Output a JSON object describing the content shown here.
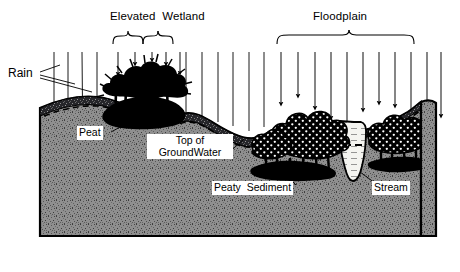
{
  "diagram": {
    "title_section_labels": {
      "elevated_wetland": "Elevated  Wetland",
      "floodplain": "Floodplain"
    },
    "annotations": {
      "rain": "Rain",
      "peat": "Peat",
      "top_of_groundwater_line1": "Top of",
      "top_of_groundwater_line2": "GroundWater",
      "peaty_sediment": "Peaty  Sediment",
      "stream": "Stream"
    },
    "colors": {
      "ink": "#000000",
      "subsurface_fill": "#8a8a8a",
      "subsurface_speckle": "#4a4a4a",
      "peat_layer": "#1b1b1b",
      "vegetation": "#000000",
      "vegetation_dots": "#ffffff",
      "stream_water": "#f2f2ee",
      "background": "#ffffff",
      "label_box": "#ffffff"
    },
    "features": {
      "rain_line_count": 24,
      "rain_arrow_count": 15,
      "groundwater_style": "dashed",
      "stream_waterline_style": "dashed",
      "subsurface_texture": "stipple",
      "floodplain_tree_texture": "dotted"
    }
  }
}
